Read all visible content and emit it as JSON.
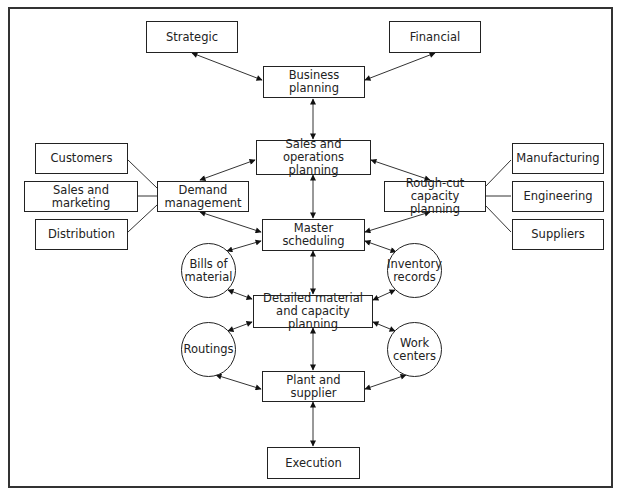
{
  "diagram": {
    "nodes": {
      "strategic": "Strategic",
      "financial": "Financial",
      "business_planning": "Business planning",
      "sop": "Sales and operations planning",
      "demand_management": "Demand management",
      "rough_cut": "Rough-cut capacity planning",
      "customers": "Customers",
      "sales_marketing": "Sales and marketing",
      "distribution": "Distribution",
      "manufacturing": "Manufacturing",
      "engineering": "Engineering",
      "suppliers": "Suppliers",
      "master_scheduling": "Master scheduling",
      "bills_of_material": "Bills of material",
      "inventory_records": "Inventory records",
      "detailed_planning": "Detailed material and capacity planning",
      "routings": "Routings",
      "work_centers": "Work centers",
      "plant_supplier": "Plant and supplier",
      "execution": "Execution"
    },
    "edges": [
      {
        "from": "strategic",
        "to": "business_planning",
        "type": "bidirectional"
      },
      {
        "from": "financial",
        "to": "business_planning",
        "type": "bidirectional"
      },
      {
        "from": "business_planning",
        "to": "sop",
        "type": "bidirectional"
      },
      {
        "from": "sop",
        "to": "demand_management",
        "type": "bidirectional"
      },
      {
        "from": "sop",
        "to": "rough_cut",
        "type": "bidirectional"
      },
      {
        "from": "sop",
        "to": "master_scheduling",
        "type": "bidirectional"
      },
      {
        "from": "demand_management",
        "to": "master_scheduling",
        "type": "bidirectional"
      },
      {
        "from": "rough_cut",
        "to": "master_scheduling",
        "type": "bidirectional"
      },
      {
        "from": "customers",
        "to": "demand_management",
        "type": "line"
      },
      {
        "from": "sales_marketing",
        "to": "demand_management",
        "type": "line"
      },
      {
        "from": "distribution",
        "to": "demand_management",
        "type": "line"
      },
      {
        "from": "manufacturing",
        "to": "rough_cut",
        "type": "line"
      },
      {
        "from": "engineering",
        "to": "rough_cut",
        "type": "line"
      },
      {
        "from": "suppliers",
        "to": "rough_cut",
        "type": "line"
      },
      {
        "from": "master_scheduling",
        "to": "bills_of_material",
        "type": "bidirectional"
      },
      {
        "from": "master_scheduling",
        "to": "inventory_records",
        "type": "bidirectional"
      },
      {
        "from": "master_scheduling",
        "to": "detailed_planning",
        "type": "bidirectional"
      },
      {
        "from": "bills_of_material",
        "to": "detailed_planning",
        "type": "bidirectional"
      },
      {
        "from": "inventory_records",
        "to": "detailed_planning",
        "type": "bidirectional"
      },
      {
        "from": "routings",
        "to": "detailed_planning",
        "type": "bidirectional"
      },
      {
        "from": "work_centers",
        "to": "detailed_planning",
        "type": "bidirectional"
      },
      {
        "from": "detailed_planning",
        "to": "plant_supplier",
        "type": "bidirectional"
      },
      {
        "from": "routings",
        "to": "plant_supplier",
        "type": "bidirectional"
      },
      {
        "from": "work_centers",
        "to": "plant_supplier",
        "type": "bidirectional"
      },
      {
        "from": "plant_supplier",
        "to": "execution",
        "type": "bidirectional"
      }
    ]
  }
}
